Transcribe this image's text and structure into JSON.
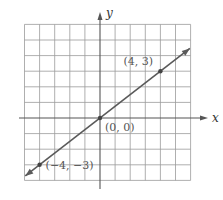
{
  "chart_data": {
    "type": "line",
    "title": "",
    "xlabel": "x",
    "ylabel": "y",
    "xlim": [
      -5,
      6
    ],
    "ylim": [
      -4,
      6
    ],
    "grid": true,
    "series": [
      {
        "name": "y = 3x/4",
        "x": [
          -4,
          0,
          4
        ],
        "y": [
          -3,
          0,
          3
        ],
        "color": "#5a5a5a"
      }
    ],
    "points": [
      {
        "x": -4,
        "y": -3,
        "label": "(−4, −3)"
      },
      {
        "x": 0,
        "y": 0,
        "label": "(0, 0)"
      },
      {
        "x": 4,
        "y": 3,
        "label": "(4, 3)"
      }
    ]
  },
  "colors": {
    "grid": "#9a9a9a",
    "axis": "#555555",
    "line": "#5a5a5a",
    "point": "#444444"
  }
}
